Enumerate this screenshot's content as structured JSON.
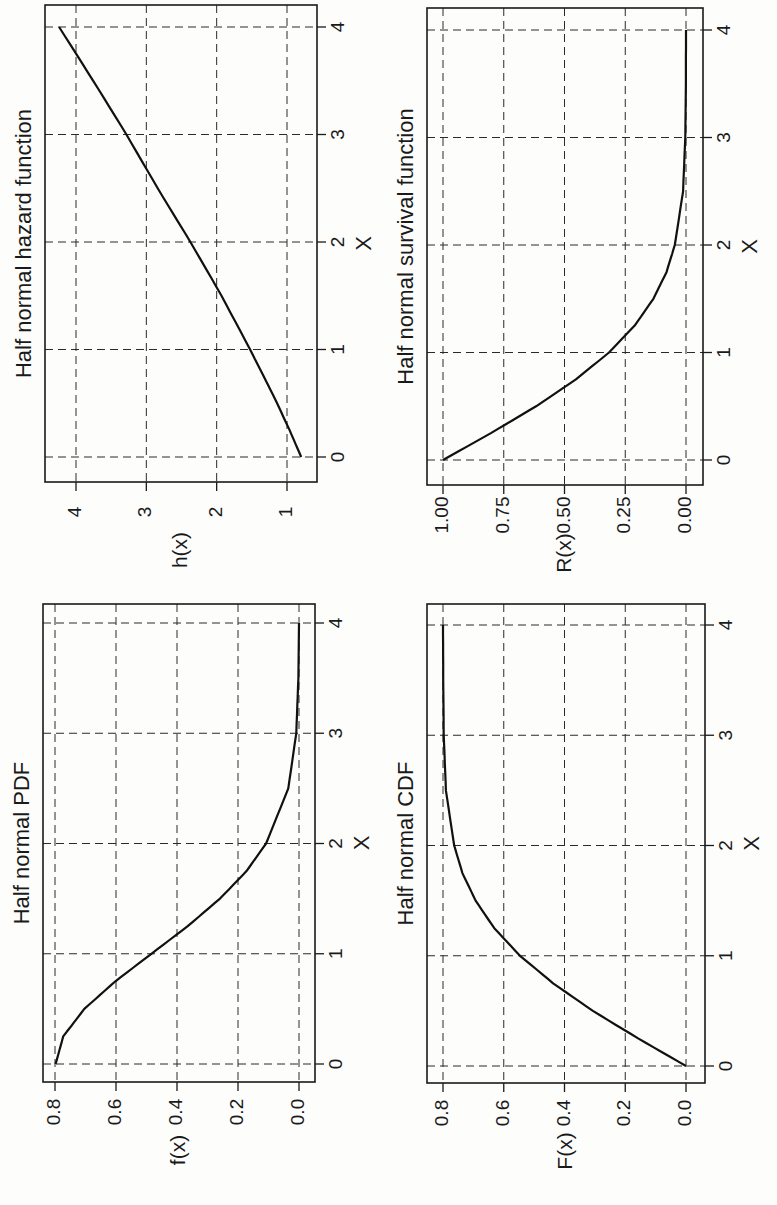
{
  "page": {
    "orientation": "rotated-90-ccw"
  },
  "chart_data": [
    {
      "id": "pdf",
      "type": "line",
      "title": "Half normal PDF",
      "xlabel": "X",
      "ylabel": "f(x)",
      "xlim": [
        0,
        4
      ],
      "ylim": [
        0,
        0.8
      ],
      "xticks": [
        "0",
        "1",
        "2",
        "3",
        "4"
      ],
      "yticks": [
        "0.0",
        "0.2",
        "0.4",
        "0.6",
        "0.8"
      ],
      "grid": true,
      "x": [
        0,
        0.25,
        0.5,
        0.75,
        1.0,
        1.25,
        1.5,
        1.75,
        2.0,
        2.5,
        3.0,
        3.5,
        4.0
      ],
      "values": [
        0.798,
        0.773,
        0.704,
        0.602,
        0.484,
        0.365,
        0.259,
        0.172,
        0.108,
        0.035,
        0.009,
        0.002,
        0.0
      ]
    },
    {
      "id": "cdf",
      "type": "line",
      "title": "Half normal CDF",
      "xlabel": "X",
      "ylabel": "F(x)",
      "xlim": [
        0,
        4
      ],
      "ylim": [
        0,
        0.8
      ],
      "xticks": [
        "0",
        "1",
        "2",
        "3",
        "4"
      ],
      "yticks": [
        "0.0",
        "0.2",
        "0.4",
        "0.6",
        "0.8"
      ],
      "grid": true,
      "x": [
        0,
        0.25,
        0.5,
        0.75,
        1.0,
        1.25,
        1.5,
        1.75,
        2.0,
        2.5,
        3.0,
        3.5,
        4.0
      ],
      "values": [
        0.0,
        0.197,
        0.383,
        0.547,
        0.683,
        0.789,
        0.866,
        0.92,
        0.954,
        0.988,
        0.997,
        0.999,
        1.0
      ],
      "note": "curve plotted as F(x)*0.8 relative to 0.8 top gridline as rendered"
    },
    {
      "id": "hazard",
      "type": "line",
      "title": "Half normal hazard function",
      "xlabel": "X",
      "ylabel": "h(x)",
      "xlim": [
        0,
        4
      ],
      "ylim": [
        0.8,
        4.25
      ],
      "xticks": [
        "0",
        "1",
        "2",
        "3",
        "4"
      ],
      "yticks": [
        "1",
        "2",
        "3",
        "4"
      ],
      "grid": true,
      "x": [
        0,
        0.25,
        0.5,
        0.75,
        1.0,
        1.5,
        2.0,
        2.5,
        3.0,
        3.5,
        4.0
      ],
      "values": [
        0.798,
        0.963,
        1.141,
        1.33,
        1.525,
        1.931,
        2.373,
        2.839,
        3.283,
        3.755,
        4.24
      ]
    },
    {
      "id": "survival",
      "type": "line",
      "title": "Half normal survival function",
      "xlabel": "X",
      "ylabel": "R(x)",
      "xlim": [
        0,
        4
      ],
      "ylim": [
        0,
        1
      ],
      "xticks": [
        "0",
        "1",
        "2",
        "3",
        "4"
      ],
      "yticks": [
        "0.00",
        "0.25",
        "0.50",
        "0.75",
        "1.00"
      ],
      "grid": true,
      "x": [
        0,
        0.25,
        0.5,
        0.75,
        1.0,
        1.25,
        1.5,
        1.75,
        2.0,
        2.5,
        3.0,
        3.5,
        4.0
      ],
      "values": [
        1.0,
        0.803,
        0.617,
        0.453,
        0.317,
        0.211,
        0.134,
        0.08,
        0.046,
        0.012,
        0.003,
        0.0005,
        0.0
      ]
    }
  ],
  "layout": {
    "hazard": {
      "frame": [
        45,
        5,
        317,
        482
      ],
      "x0": 457,
      "x4": 27,
      "v_lo": 1,
      "v_lo_px": 287,
      "v_hi": 4,
      "v_hi_px": 76
    },
    "survival": {
      "frame": [
        427,
        8,
        703,
        485
      ],
      "x0": 460,
      "x4": 30,
      "v_lo": 0,
      "v_lo_px": 686,
      "v_hi": 1,
      "v_hi_px": 443
    },
    "pdf": {
      "frame": [
        43,
        604,
        315,
        1082
      ],
      "x0": 1064,
      "x4": 623,
      "v_lo": 0,
      "v_lo_px": 299,
      "v_hi": 0.8,
      "v_hi_px": 55
    },
    "cdf": {
      "frame": [
        427,
        604,
        705,
        1083
      ],
      "x0": 1066,
      "x4": 625,
      "v_lo": 0,
      "v_lo_px": 686,
      "v_hi": 0.8,
      "v_hi_px": 443
    }
  }
}
